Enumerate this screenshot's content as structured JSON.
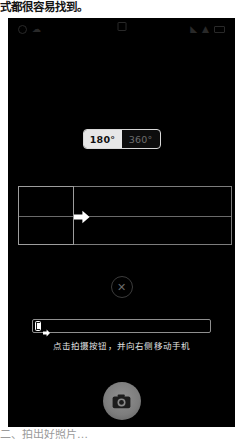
{
  "document": {
    "text_above": "式都很容易找到。",
    "text_below": "二、拍出好照片…"
  },
  "screenshot": {
    "app": "camera-panorama",
    "background_color": "#000000",
    "status_bar": {
      "left_icons": [
        "location-icon",
        "cloud-icon"
      ],
      "center_icons": [
        "camera-badge-icon"
      ],
      "right_icons": [
        "signal-icon",
        "wifi-icon",
        "battery-icon"
      ]
    },
    "mode_toggle": {
      "name": "panorama-angle-toggle",
      "options": [
        {
          "label": "180°",
          "selected": true
        },
        {
          "label": "360°",
          "selected": false
        }
      ],
      "selected_value": "180°",
      "active_bg": "#e7e7e7",
      "active_fg": "#111111",
      "inactive_fg": "#6e6e6e"
    },
    "panorama_guide": {
      "name": "panorama-alignment-guide",
      "frame_color": "#7d7d7d",
      "box_color": "#9d9d9d",
      "arrow_color": "#ffffff",
      "arrow_direction": "right"
    },
    "close_button": {
      "name": "close-button",
      "glyph": "✕",
      "color": "#6a6a6a"
    },
    "progress": {
      "name": "panorama-progress-bar",
      "percent": 0,
      "track_color": "#8f8f8f",
      "thumb_icon": "phone-icon",
      "thumb_arrow": "arrow-right-icon"
    },
    "instruction": "点击拍摄按钮，并向右侧移动手机",
    "shutter": {
      "name": "shutter-button",
      "icon": "camera-icon",
      "color": "#7d7d7d"
    }
  }
}
